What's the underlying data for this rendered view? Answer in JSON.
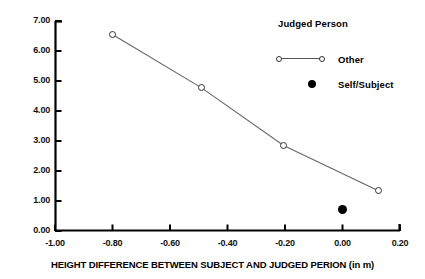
{
  "chart_data": {
    "type": "line",
    "title": "",
    "xlabel": "HEIGHT DIFFERENCE BETWEEN  SUBJECT AND JUDGED PERION (in m)",
    "ylabel": "",
    "xlim": [
      -1.0,
      0.2
    ],
    "ylim": [
      0.0,
      7.0
    ],
    "grid": false,
    "xticks": [
      "-1.00",
      "-0.80",
      "-0.60",
      "-0.40",
      "-0.20",
      "0.00",
      "0.20"
    ],
    "xtick_values": [
      -1.0,
      -0.8,
      -0.6,
      -0.4,
      -0.2,
      0.0,
      0.2
    ],
    "yticks": [
      "0.00",
      "1.00",
      "2.00",
      "3.00",
      "4.00",
      "5.00",
      "6.00",
      "7.00"
    ],
    "ytick_values": [
      0.0,
      1.0,
      2.0,
      3.0,
      4.0,
      5.0,
      6.0,
      7.0
    ],
    "legend_title": "Judged Person",
    "legend_position": "upper-right",
    "series": [
      {
        "name": "Other",
        "marker": "open-circle",
        "line": true,
        "color": "#555555",
        "x": [
          -0.8,
          -0.49,
          -0.205,
          0.125
        ],
        "y": [
          6.55,
          4.77,
          2.85,
          1.34
        ]
      },
      {
        "name": "Self/Subject",
        "marker": "filled-circle",
        "line": false,
        "color": "#000000",
        "x": [
          0.0
        ],
        "y": [
          0.72
        ]
      }
    ]
  },
  "legend": {
    "title": "Judged Person",
    "entries": [
      {
        "label": "Other"
      },
      {
        "label": "Self/Subject"
      }
    ]
  },
  "axis": {
    "x_title": "HEIGHT DIFFERENCE BETWEEN  SUBJECT AND JUDGED PERION (in m)"
  }
}
